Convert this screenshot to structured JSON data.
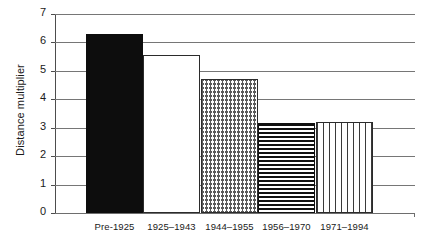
{
  "chart_data": {
    "type": "bar",
    "title": "",
    "subtitle": "",
    "xlabel": "",
    "ylabel": "Distance multiplier",
    "categories": [
      "Pre-1925",
      "1925–1943",
      "1944–1955",
      "1956–1970",
      "1971–1994"
    ],
    "values": [
      6.3,
      5.55,
      4.7,
      3.15,
      3.2
    ],
    "series": [
      {
        "name": "Distance multiplier",
        "values": [
          6.3,
          5.55,
          4.7,
          3.15,
          3.2
        ]
      }
    ],
    "bar_fills": [
      "solid-black",
      "white",
      "zigzag",
      "hlines",
      "vdash"
    ],
    "ylim": [
      0,
      7
    ],
    "yticks": [
      0,
      1,
      2,
      3,
      4,
      5,
      6,
      7
    ],
    "ytick_labels": [
      "0",
      "1",
      "2",
      "3",
      "4",
      "5",
      "6",
      "7"
    ],
    "grid": true,
    "grid_axis": "y",
    "legend": false,
    "legend_position": "none",
    "colors": {
      "bar_outline": "#2b2b2b",
      "bar_solid": "#0d0d0d",
      "gridline": "#767676",
      "axis": "#4d4d4d",
      "text": "#1a1a1a",
      "background": "#ffffff"
    }
  },
  "axis": {
    "y_title": "Distance multiplier"
  }
}
